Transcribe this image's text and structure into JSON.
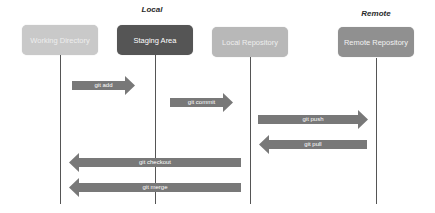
{
  "sections": [
    {
      "label": "Local",
      "x": 152,
      "y": 5
    },
    {
      "label": "Remote",
      "x": 376,
      "y": 9
    }
  ],
  "boxes": [
    {
      "label": "Working Directory",
      "x": 22,
      "y": 25,
      "w": 76,
      "color": "#c9c9c9",
      "text_color": "#eeeeee"
    },
    {
      "label": "Staging Area",
      "x": 117,
      "y": 25,
      "w": 76,
      "color": "#555555",
      "text_color": "#ffffff"
    },
    {
      "label": "Local Repository",
      "x": 212,
      "y": 27,
      "w": 76,
      "color": "#b8b8b8",
      "text_color": "#eeeeee"
    },
    {
      "label": "Remote Repository",
      "x": 338,
      "y": 27,
      "w": 76,
      "color": "#909090",
      "text_color": "#f2f2f2"
    }
  ],
  "lifelines": [
    {
      "x": 60,
      "top": 55,
      "bottom": 204
    },
    {
      "x": 155,
      "top": 55,
      "bottom": 204
    },
    {
      "x": 250,
      "top": 57,
      "bottom": 204
    },
    {
      "x": 376,
      "top": 58,
      "bottom": 204
    }
  ],
  "arrows": [
    {
      "label": "git add",
      "x1": 72,
      "x2": 135,
      "y": 85,
      "direction": "right"
    },
    {
      "label": "git commit",
      "x1": 170,
      "x2": 233,
      "y": 102,
      "direction": "right"
    },
    {
      "label": "git push",
      "x1": 258,
      "x2": 368,
      "y": 119,
      "direction": "right"
    },
    {
      "label": "git pull",
      "x1": 259,
      "x2": 367,
      "y": 144,
      "direction": "left"
    },
    {
      "label": "git checkout",
      "x1": 69,
      "x2": 241,
      "y": 162,
      "direction": "left"
    },
    {
      "label": "git merge",
      "x1": 69,
      "x2": 241,
      "y": 187,
      "direction": "left"
    }
  ],
  "colors": {
    "arrow": "#787878",
    "lifeline": "#555555"
  }
}
